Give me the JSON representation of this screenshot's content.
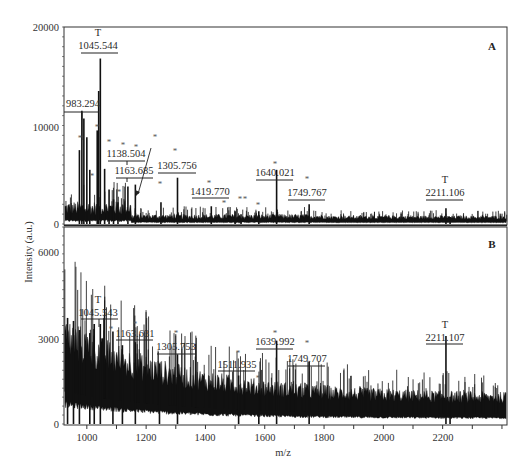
{
  "chart_data": [
    {
      "panel": "A",
      "type": "line",
      "title": "",
      "xlabel": "m/z",
      "ylabel": "Intensity (a.u.)",
      "xlim": [
        923,
        2417
      ],
      "ylim": [
        0,
        20000
      ],
      "yticks": [
        0,
        10000,
        20000
      ],
      "xticks": [
        1000,
        1200,
        1400,
        1600,
        1800,
        2000,
        2200
      ],
      "grid": false,
      "annotated_peaks": [
        {
          "mz": 983.294,
          "label": "983.294",
          "intensity": 11500,
          "marker": ""
        },
        {
          "mz": 1045.544,
          "label": "1045.544",
          "intensity": 16800,
          "marker": "T"
        },
        {
          "mz": 1138.504,
          "label": "1138.504",
          "intensity": 3800,
          "marker": "*"
        },
        {
          "mz": 1163.685,
          "label": "1163.685",
          "intensity": 4000,
          "marker": "*"
        },
        {
          "mz": 1305.756,
          "label": "1305.756",
          "intensity": 4700,
          "marker": "*"
        },
        {
          "mz": 1419.77,
          "label": "1419.770",
          "intensity": 1800,
          "marker": "*"
        },
        {
          "mz": 1640.021,
          "label": "1640.021",
          "intensity": 5500,
          "marker": "*"
        },
        {
          "mz": 1749.767,
          "label": "1749.767",
          "intensity": 2000,
          "marker": "*"
        },
        {
          "mz": 2211.106,
          "label": "2211.106",
          "intensity": 1600,
          "marker": "T"
        }
      ],
      "unlabeled_star_peaks_mz": [
        975,
        1030,
        1110,
        1125,
        1180,
        1245,
        1270,
        1480,
        1510,
        1530,
        1575
      ],
      "panel_letter": "A"
    },
    {
      "panel": "B",
      "type": "line",
      "title": "",
      "xlabel": "m/z",
      "ylabel": "Intensity (a.u.)",
      "xlim": [
        923,
        2417
      ],
      "ylim": [
        0,
        6500
      ],
      "yticks": [
        0,
        3000,
        6000
      ],
      "xticks": [
        1000,
        1200,
        1400,
        1600,
        1800,
        2000,
        2200
      ],
      "grid": false,
      "annotated_peaks": [
        {
          "mz": 1045.543,
          "label": "1045.543",
          "intensity": 3300,
          "marker": "T"
        },
        {
          "mz": 1163.631,
          "label": "1163.631",
          "intensity": 2700,
          "marker": "*"
        },
        {
          "mz": 1305.753,
          "label": "1305.753",
          "intensity": 2300,
          "marker": "*"
        },
        {
          "mz": 1511.935,
          "label": "1511.935",
          "intensity": 1600,
          "marker": "*"
        },
        {
          "mz": 1639.992,
          "label": "1639.992",
          "intensity": 2750,
          "marker": "*"
        },
        {
          "mz": 1749.707,
          "label": "1749.707",
          "intensity": 2050,
          "marker": "*"
        },
        {
          "mz": 2211.107,
          "label": "2211.107",
          "intensity": 2900,
          "marker": "T"
        }
      ],
      "unlabeled_star_peaks_mz": [
        1088,
        1580
      ],
      "panel_letter": "B"
    }
  ],
  "labels": {
    "xlabel": "m/z",
    "ylabel": "Intensity (a.u.)",
    "panel_a": "A",
    "panel_b": "B",
    "a_yticks": [
      "20000",
      "10000",
      "0"
    ],
    "b_yticks": [
      "6000",
      "3000",
      "0"
    ],
    "xticks": [
      "1000",
      "1200",
      "1400",
      "1600",
      "1800",
      "2000",
      "2200"
    ],
    "a_peaks": [
      "983.294",
      "1045.544",
      "1138.504",
      "1163.685",
      "1305.756",
      "1419.770",
      "1640.021",
      "1749.767",
      "2211.106"
    ],
    "b_peaks": [
      "1045.543",
      "1163.631",
      "1305.753",
      "1511.935",
      "1639.992",
      "1749.707",
      "2211.107"
    ],
    "t_marker": "T",
    "star_marker": "*"
  }
}
